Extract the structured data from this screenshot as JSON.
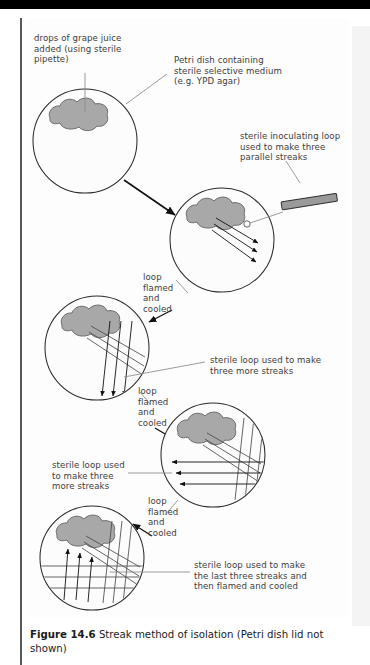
{
  "figure": {
    "number": "Figure 14.6",
    "caption": "Streak method of isolation (Petri dish lid not shown)",
    "caption_full": "Figure 14.6  Streak method of isolation (Petri dish lid not shown)"
  },
  "labels": {
    "grape_juice": "drops of grape juice\nadded (using sterile\npipette)",
    "petri_dish": "Petri dish containing\nsterile selective medium\n(e.g. YPD agar)",
    "inoculating_loop": "sterile inoculating loop\nused to make three\nparallel streaks",
    "flamed_1": "loop\nflamed\nand\ncooled",
    "flamed_2": "loop\nflamed\nand\ncooled",
    "flamed_3": "loop\nflamed\nand\ncooled",
    "streaks_2": "sterile loop used to make\nthree more streaks",
    "streaks_3": "sterile loop used\nto make three\nmore streaks",
    "streaks_4": "sterile loop used to make\nthe last three streaks and\nthen flamed and cooled"
  },
  "dishes": [
    {
      "id": "dish-1",
      "step": 1,
      "cx": 85,
      "cy": 141,
      "r": 52,
      "streak_sets": 0,
      "has_inoculum": true
    },
    {
      "id": "dish-2",
      "step": 2,
      "cx": 222,
      "cy": 240,
      "r": 52,
      "streak_sets": 1,
      "has_inoculum": true
    },
    {
      "id": "dish-3",
      "step": 3,
      "cx": 97,
      "cy": 348,
      "r": 52,
      "streak_sets": 2,
      "has_inoculum": true
    },
    {
      "id": "dish-4",
      "step": 4,
      "cx": 213,
      "cy": 455,
      "r": 52,
      "streak_sets": 3,
      "has_inoculum": true
    },
    {
      "id": "dish-5",
      "step": 5,
      "cx": 92,
      "cy": 558,
      "r": 52,
      "streak_sets": 4,
      "has_inoculum": true
    }
  ],
  "colors": {
    "inoculum_fill": "#a8a8a8",
    "inoculum_stroke": "#6e6e6e",
    "dish_stroke": "#2b2b2b",
    "streak_stroke": "#4a4a4a",
    "arrow_stroke": "#111111",
    "leader_stroke": "#8a8a8a",
    "loop_handle": "#9a9a9a",
    "text": "#3c3c3c",
    "caption_text": "#1b1b1b",
    "background": "#ffffff"
  },
  "loop_tool": {
    "name": "inoculating loop",
    "handle_x": 300,
    "handle_y": 207,
    "loop_ring_x": 247,
    "loop_ring_y": 224
  }
}
